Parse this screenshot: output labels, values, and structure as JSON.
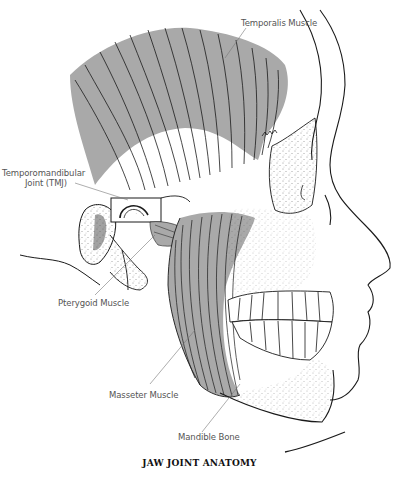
{
  "figure": {
    "title": "JAW JOINT ANATOMY",
    "colors": {
      "muscle_fill": "#a9a9a9",
      "line": "#1a1a1a",
      "label_text": "#555555",
      "leader": "#777777",
      "background": "#ffffff"
    },
    "labels": {
      "temporalis": "Temporalis Muscle",
      "tmj_line1": "Temporomandibular",
      "tmj_line2": "Joint (TMJ)",
      "pterygoid": "Pterygoid Muscle",
      "masseter": "Masseter Muscle",
      "mandible": "Mandible Bone"
    }
  }
}
